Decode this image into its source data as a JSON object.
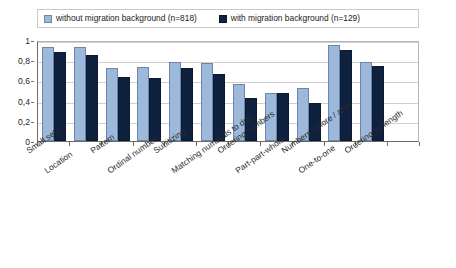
{
  "chart_data": {
    "type": "bar",
    "title": "",
    "subtitle": "",
    "xlabel": "",
    "ylabel": "",
    "ylim": [
      0,
      1
    ],
    "ytick_labels": [
      "0",
      "0,2",
      "0,4",
      "0,6",
      "0,8",
      "1"
    ],
    "ytick_values": [
      0,
      0.2,
      0.4,
      0.6,
      0.8,
      1
    ],
    "grid": true,
    "legend_position": "top",
    "categories": [
      "Small sets",
      "Location",
      "Pattern",
      "Ordinal number",
      "Subitizing",
      "Matching numerals to dots",
      "Ordering numbers",
      "Part-part-whole",
      "Numbers before / after",
      "One-to-one",
      "Ordering by length"
    ],
    "series": [
      {
        "name": "without migration background (n=818)",
        "color": "#9CB9DC",
        "values": [
          0.93,
          0.93,
          0.72,
          0.73,
          0.78,
          0.77,
          0.56,
          0.48,
          0.52,
          0.95,
          0.78
        ]
      },
      {
        "name": "with migration background (n=129)",
        "color": "#10203F",
        "values": [
          0.88,
          0.85,
          0.63,
          0.62,
          0.72,
          0.66,
          0.43,
          0.48,
          0.38,
          0.9,
          0.74
        ]
      }
    ]
  },
  "legend": {
    "entries": [
      {
        "label": "without migration background (n=818)",
        "swatch": "light"
      },
      {
        "label": "with migration background (n=129)",
        "swatch": "dark"
      }
    ]
  },
  "colors": {
    "series_light": "#9CB9DC",
    "series_dark": "#10203F",
    "grid": "#CFCFCF",
    "axis": "#6B6B6B",
    "background": "#FFFFFF"
  }
}
